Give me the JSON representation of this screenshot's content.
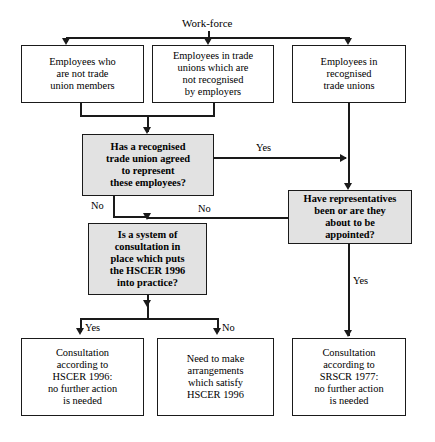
{
  "diagram": {
    "title": "Work-force",
    "colors": {
      "line": "#1a1a1a",
      "decision_fill": "#e2e2e2",
      "process_fill": "#ffffff",
      "text": "#000000"
    },
    "nodes": {
      "workforce_a": "Employees who\nare not trade\nunion members",
      "workforce_b": "Employees in trade\nunions which are\nnot recognised\nby employers",
      "workforce_c": "Employees in\nrecognised\ntrade unions",
      "decision_recognised_union": "Has a recognised\ntrade union agreed\nto represent\nthese employees?",
      "decision_representatives": "Have representatives\nbeen or are they\nabout to be\nappointed?",
      "decision_hscer_system": "Is a system of\nconsultation in\nplace which puts\nthe HSCER 1996\ninto practice?",
      "outcome_hscer_ok": "Consultation\naccording to\nHSCER 1996:\nno further action\nis needed",
      "outcome_need_arrangements": "Need to make\narrangements\nwhich satisfy\nHSCER 1996",
      "outcome_srscr_ok": "Consultation\naccording to\nSRSCR 1977:\nno further action\nis needed"
    },
    "edge_labels": {
      "union_yes": "Yes",
      "union_no": "No",
      "reps_no": "No",
      "reps_yes": "Yes",
      "hscer_yes": "Yes",
      "hscer_no": "No"
    }
  }
}
